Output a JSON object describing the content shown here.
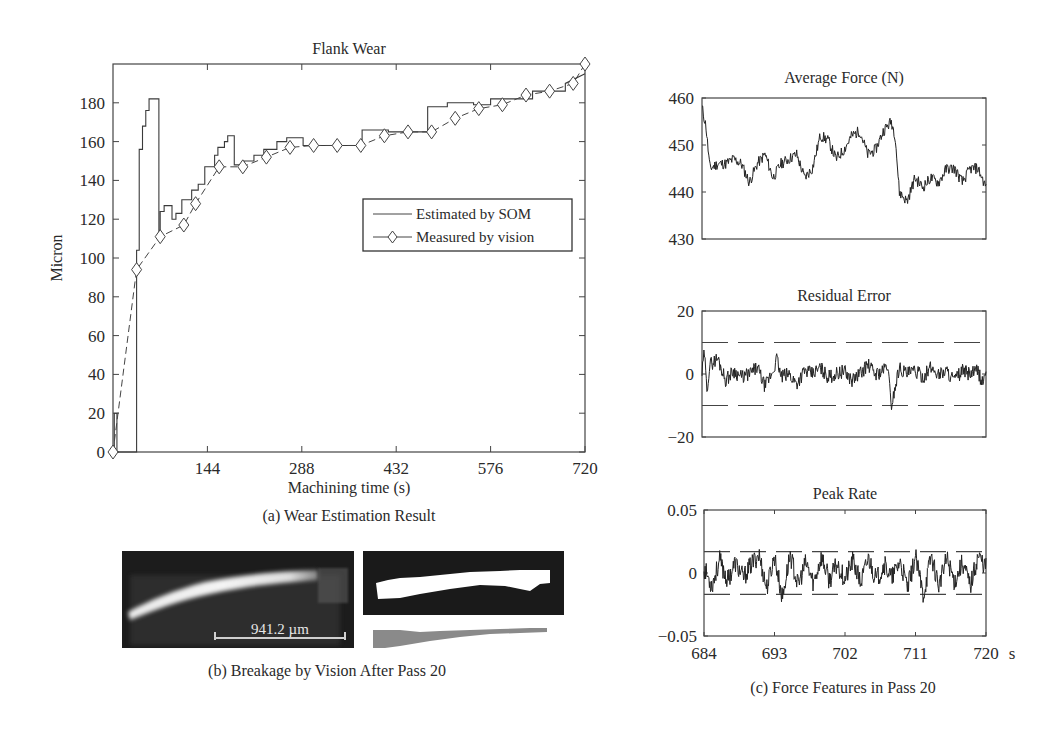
{
  "figure": {
    "caption_a": "(a) Wear Estimation Result",
    "caption_b": "(b) Breakage by Vision After Pass 20",
    "caption_c": "(c) Force Features in Pass 20",
    "scale_bar_label": "941.2 µm"
  },
  "chart_data": [
    {
      "id": "flank-wear",
      "type": "line",
      "title": "Flank Wear",
      "xlabel": "Machining time (s)",
      "ylabel": "Micron",
      "xlim": [
        0,
        720
      ],
      "ylim": [
        0,
        200
      ],
      "xticks": [
        144,
        288,
        432,
        576,
        720
      ],
      "yticks": [
        0,
        20,
        40,
        60,
        80,
        100,
        120,
        140,
        160,
        180
      ],
      "grid": false,
      "legend_position": "center-right",
      "legend": [
        "Estimated by SOM",
        "Measured by vision"
      ],
      "series": [
        {
          "name": "Estimated by SOM",
          "style": "solid-step",
          "x": [
            0,
            2,
            2,
            6,
            6,
            12,
            12,
            36,
            36,
            40,
            40,
            45,
            45,
            50,
            50,
            55,
            55,
            60,
            60,
            70,
            70,
            72,
            72,
            78,
            78,
            90,
            90,
            96,
            96,
            105,
            105,
            120,
            120,
            130,
            130,
            140,
            140,
            155,
            155,
            160,
            160,
            170,
            170,
            175,
            175,
            185,
            185,
            200,
            200,
            215,
            215,
            230,
            230,
            250,
            250,
            265,
            265,
            290,
            290,
            330,
            330,
            380,
            380,
            420,
            420,
            470,
            470,
            480,
            480,
            510,
            510,
            550,
            550,
            576,
            576,
            640,
            640,
            690,
            690,
            720
          ],
          "y": [
            0,
            0,
            20,
            20,
            0,
            0,
            0,
            0,
            104,
            104,
            156,
            156,
            168,
            168,
            176,
            176,
            182,
            182,
            182,
            182,
            111,
            111,
            124,
            124,
            127,
            127,
            120,
            120,
            123,
            123,
            130,
            130,
            135,
            135,
            138,
            138,
            147,
            147,
            153,
            153,
            157,
            157,
            160,
            160,
            163,
            163,
            148,
            148,
            150,
            150,
            153,
            153,
            156,
            156,
            160,
            160,
            162,
            162,
            158,
            158,
            158,
            158,
            166,
            166,
            165,
            165,
            165,
            165,
            178,
            178,
            180,
            180,
            179,
            179,
            182,
            182,
            186,
            186,
            190,
            195
          ]
        },
        {
          "name": "Measured by vision",
          "style": "dashed-diamond",
          "x": [
            0,
            36,
            72,
            108,
            126,
            162,
            198,
            234,
            270,
            306,
            342,
            378,
            414,
            450,
            486,
            522,
            558,
            594,
            630,
            666,
            702,
            720
          ],
          "y": [
            0,
            94,
            111,
            117,
            128,
            147,
            147,
            152,
            157,
            158,
            158,
            158,
            163,
            165,
            165,
            172,
            177,
            179,
            184,
            186,
            190,
            200
          ]
        }
      ]
    },
    {
      "id": "average-force",
      "type": "line",
      "title": "Average Force (N)",
      "xlim": [
        684,
        720
      ],
      "ylim": [
        430,
        460
      ],
      "yticks": [
        430,
        440,
        450,
        460
      ],
      "series": [
        {
          "name": "Average Force",
          "x": [
            684,
            684.5,
            685,
            686,
            687,
            688,
            689,
            690,
            691,
            692,
            693,
            694,
            695,
            696,
            697,
            698,
            699,
            700,
            701,
            702,
            703,
            704,
            705,
            706,
            707,
            708,
            708.5,
            709,
            710,
            711,
            712,
            713,
            714,
            715,
            716,
            717,
            718,
            719,
            720
          ],
          "y": [
            458,
            454,
            445,
            446,
            446,
            447,
            446,
            442,
            446,
            448,
            443,
            446,
            447,
            448,
            443,
            445,
            452,
            451,
            447,
            449,
            452,
            453,
            448,
            449,
            453,
            455,
            452,
            440,
            438,
            443,
            441,
            443,
            442,
            445,
            445,
            442,
            445,
            445,
            441
          ]
        }
      ]
    },
    {
      "id": "residual-error",
      "type": "line",
      "title": "Residual Error",
      "xlim": [
        684,
        720
      ],
      "ylim": [
        -20,
        20
      ],
      "yticks": [
        -20,
        0,
        20
      ],
      "thresholds": [
        10,
        -10
      ],
      "series": [
        {
          "name": "Residual Error",
          "x": [
            684,
            684.3,
            684.6,
            685,
            686,
            687,
            688,
            689,
            690,
            691,
            692,
            693,
            693.5,
            694,
            695,
            696,
            697,
            698,
            699,
            700,
            701,
            702,
            703,
            704,
            705,
            706,
            707,
            707.5,
            708,
            709,
            710,
            711,
            712,
            713,
            714,
            715,
            716,
            717,
            718,
            719,
            719.5,
            720
          ],
          "y": [
            0,
            7,
            -5,
            3,
            5,
            -2,
            1,
            -1,
            0,
            2,
            -4,
            1,
            5,
            -1,
            0,
            -3,
            1,
            0,
            2,
            -1,
            0,
            1,
            -2,
            0,
            3,
            0,
            1,
            3,
            -10,
            2,
            0,
            1,
            -1,
            2,
            0,
            1,
            -2,
            1,
            0,
            1,
            -3,
            1
          ]
        }
      ]
    },
    {
      "id": "peak-rate",
      "type": "line",
      "title": "Peak Rate",
      "xlabel": "s",
      "xlim": [
        684,
        720
      ],
      "ylim": [
        -0.05,
        0.05
      ],
      "xticks": [
        684,
        693,
        702,
        711,
        720
      ],
      "yticks": [
        -0.05,
        0,
        0.05
      ],
      "thresholds": [
        0.017,
        -0.017
      ],
      "series": [
        {
          "name": "Peak Rate",
          "x": [
            684,
            685,
            686,
            687,
            688,
            689,
            690,
            691,
            692,
            693,
            694,
            695,
            696,
            697,
            698,
            699,
            700,
            701,
            702,
            703,
            704,
            705,
            706,
            707,
            708,
            709,
            710,
            711,
            712,
            713,
            714,
            715,
            716,
            717,
            718,
            719,
            720
          ],
          "y": [
            0.004,
            -0.01,
            0.01,
            -0.006,
            0.008,
            -0.004,
            0.006,
            0.015,
            -0.012,
            0.013,
            -0.02,
            0.015,
            -0.01,
            0.008,
            -0.008,
            0.013,
            -0.006,
            0.007,
            -0.005,
            0.01,
            -0.008,
            0.012,
            -0.006,
            0.007,
            -0.004,
            0.009,
            -0.012,
            0.013,
            -0.018,
            0.014,
            -0.01,
            0.012,
            -0.007,
            0.009,
            -0.01,
            0.014,
            0.005
          ]
        }
      ]
    }
  ],
  "labels": {
    "flank_title": "Flank Wear",
    "flank_xlabel": "Machining time (s)",
    "flank_ylabel": "Micron",
    "flank_xticks": [
      "144",
      "288",
      "432",
      "576",
      "720"
    ],
    "flank_yticks": [
      "0",
      "20",
      "40",
      "60",
      "80",
      "100",
      "120",
      "140",
      "160",
      "180"
    ],
    "legend_som": "Estimated by SOM",
    "legend_vision": "Measured by vision",
    "force_title": "Average Force (N)",
    "force_yticks": [
      "430",
      "440",
      "450",
      "460"
    ],
    "resid_title": "Residual Error",
    "resid_yticks": [
      "−20",
      "0",
      "20"
    ],
    "peak_title": "Peak Rate",
    "peak_yticks": [
      "−0.05",
      "0",
      "0.05"
    ],
    "peak_xticks": [
      "684",
      "693",
      "702",
      "711",
      "720"
    ],
    "peak_xunit": "s"
  }
}
